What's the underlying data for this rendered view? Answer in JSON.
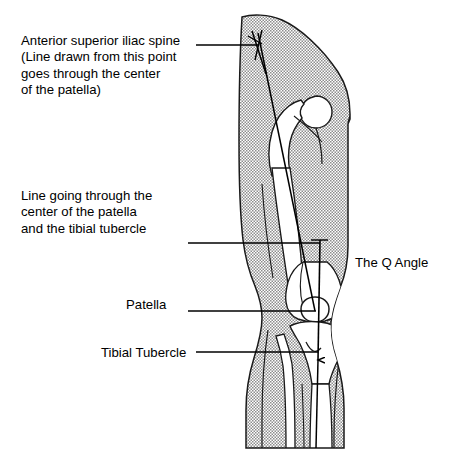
{
  "figure": {
    "title": "The Q Angle",
    "view": "anterior view of right lower limb"
  },
  "labels": {
    "anterior_superior_iliac_spine": "Anterior superior iliac spine\n(Line drawn from this point\ngoes through the center\nof the patella)",
    "line_through_patella_and_tubercle": "Line going through the\ncenter of the patella\nand the tibial tubercle",
    "patella": "Patella",
    "tibial_tubercle": "Tibial Tubercle",
    "q_angle": "The Q Angle"
  },
  "colors": {
    "ink": "#000000",
    "outline": "#1a1a1a",
    "limb_fill": "#c9c9c9",
    "bone_fill": "#ffffff",
    "background": "#ffffff"
  },
  "geometry": {
    "asis_point": {
      "x": 258,
      "y": 33
    },
    "patella_center": {
      "x": 315,
      "y": 311
    },
    "tibial_tubercle": {
      "x": 318,
      "y": 352
    },
    "q_vertical_line_top": {
      "x": 320,
      "y": 240
    },
    "arrowhead_tip": {
      "x": 318,
      "y": 360
    }
  },
  "leader_lines": {
    "asis": {
      "from_x": 196,
      "from_y": 45,
      "to_x": 258,
      "to_y": 45
    },
    "q_line_label": {
      "from_x": 188,
      "from_y": 243,
      "to_x": 320,
      "to_y": 243
    },
    "patella": {
      "from_x": 188,
      "from_y": 311,
      "to_x": 316,
      "to_y": 311
    },
    "tibial_tubercle": {
      "from_x": 196,
      "from_y": 352,
      "to_x": 318,
      "to_y": 352
    }
  }
}
